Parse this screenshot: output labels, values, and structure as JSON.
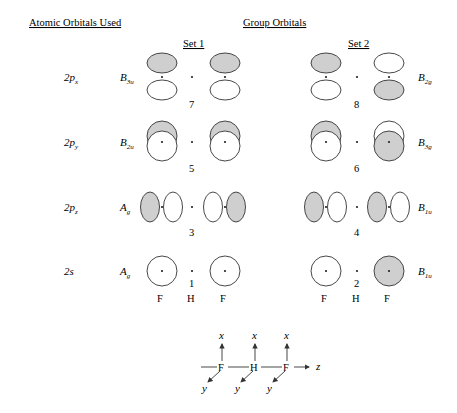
{
  "headers": {
    "atomic": "Atomic Orbitals Used",
    "group": "Group Orbitals",
    "set1": "Set 1",
    "set2": "Set 2"
  },
  "colors": {
    "shade": "#cfcfcf",
    "line": "#333333"
  },
  "rows": [
    {
      "ao": "2p",
      "ao_sub": "x",
      "set1_sym": "B",
      "set1_sub": "3u",
      "set1_num": "7",
      "set2_sym": "B",
      "set2_sub": "2g",
      "set2_num": "8"
    },
    {
      "ao": "2p",
      "ao_sub": "y",
      "set1_sym": "B",
      "set1_sub": "2u",
      "set1_num": "5",
      "set2_sym": "B",
      "set2_sub": "3g",
      "set2_num": "6"
    },
    {
      "ao": "2p",
      "ao_sub": "z",
      "set1_sym": "A",
      "set1_sub": "g",
      "set1_num": "3",
      "set2_sym": "B",
      "set2_sub": "1u",
      "set2_num": "4"
    },
    {
      "ao": "2s",
      "ao_sub": "",
      "set1_sym": "A",
      "set1_sub": "g",
      "set1_num": "1",
      "set2_sym": "B",
      "set2_sub": "1u",
      "set2_num": "2"
    }
  ],
  "atoms": {
    "f": "F",
    "h": "H"
  },
  "axes": {
    "x": "x",
    "y": "y",
    "z": "z",
    "atoms": [
      "F",
      "H",
      "F"
    ]
  }
}
